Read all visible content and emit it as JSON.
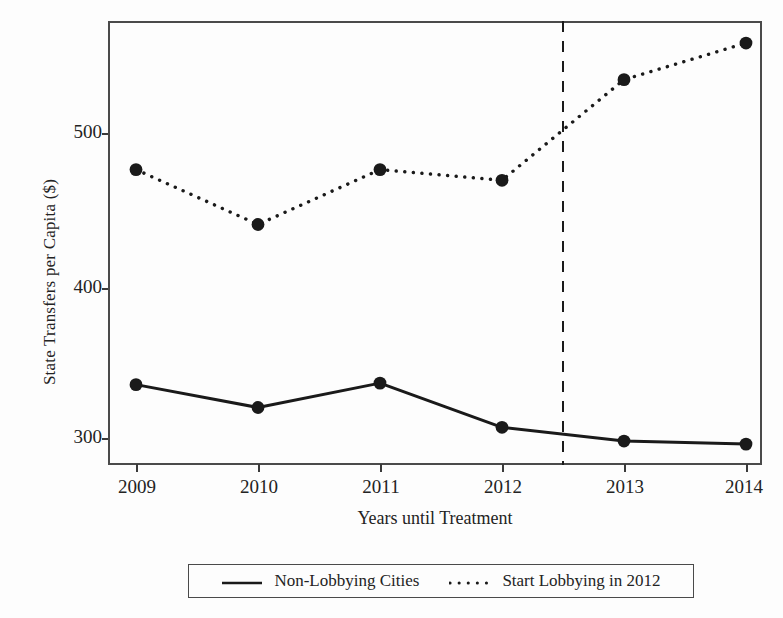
{
  "chart_data": {
    "type": "line",
    "title": "",
    "subtitle": "",
    "xlabel": "Years until Treatment",
    "ylabel": "State Transfers per Capita ($)",
    "categories": [
      "2009",
      "2010",
      "2011",
      "2012",
      "2013",
      "2014"
    ],
    "x": [
      2009,
      2010,
      2011,
      2012,
      2013,
      2014
    ],
    "series": [
      {
        "name": "Non-Lobbying Cities",
        "style": "solid",
        "marker": "filled-circle",
        "color": "#1a1a1a",
        "values": [
          335,
          320,
          336,
          307,
          298,
          296
        ]
      },
      {
        "name": "Start Lobbying in 2012",
        "style": "dotted",
        "marker": "filled-circle",
        "color": "#1a1a1a",
        "values": [
          476,
          440,
          476,
          469,
          535,
          559
        ]
      }
    ],
    "y_ticks": [
      300,
      400,
      500
    ],
    "y_tick_labels": [
      "300",
      "400",
      "500"
    ],
    "x_tick_labels": [
      "2009",
      "2010",
      "2011",
      "2012",
      "2013",
      "2014"
    ],
    "ylim": [
      268,
      578
    ],
    "xlim": [
      2008.75,
      2014.3
    ],
    "grid": false,
    "legend_position": "bottom-outside",
    "annotations": [
      {
        "type": "vertical-dashed-line",
        "x": 2012.5,
        "label": ""
      }
    ]
  },
  "axes": {
    "y_title": "State Transfers per Capita ($)",
    "x_title": "Years until Treatment",
    "y_ticks": [
      {
        "label": "500",
        "value": 500
      },
      {
        "label": "400",
        "value": 400
      },
      {
        "label": "300",
        "value": 300
      }
    ],
    "x_ticks": [
      {
        "label": "2009",
        "value": 2009
      },
      {
        "label": "2010",
        "value": 2010
      },
      {
        "label": "2011",
        "value": 2011
      },
      {
        "label": "2012",
        "value": 2012
      },
      {
        "label": "2013",
        "value": 2013
      },
      {
        "label": "2014",
        "value": 2014
      }
    ]
  },
  "legend": {
    "entries": [
      {
        "label": "Non-Lobbying Cities",
        "style": "solid"
      },
      {
        "label": "Start Lobbying in 2012",
        "style": "dotted"
      }
    ]
  },
  "colors": {
    "line": "#1a1a1a",
    "frame": "#4a4a4a",
    "text": "#232323",
    "background": "#fdfdfd"
  }
}
